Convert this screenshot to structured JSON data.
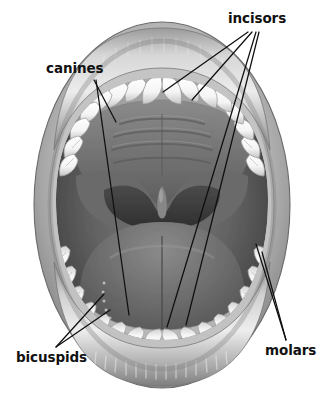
{
  "figure": {
    "type": "anatomical-illustration",
    "style": "grayscale halftone drawing",
    "background_color": "#ffffff",
    "ink_color": "#111111"
  },
  "labels": {
    "incisors": "incisors",
    "canines": "canines",
    "bicuspids": "bicuspids",
    "molars": "molars"
  },
  "colors": {
    "text": "#111111",
    "leader_line": "#101010",
    "lip_light": "#d8d8d8",
    "lip_mid": "#a6a6a6",
    "lip_dark": "#6f6f6f",
    "tooth_white": "#fbfbfb",
    "tooth_shadow": "#c9c9c9",
    "gum_light": "#bdbdbd",
    "gum_dark": "#8a8a8a",
    "cavity_dark": "#4a4a4a",
    "throat_black": "#3a3a3a",
    "tongue_mid": "#6e6e6e",
    "palate_gray": "#7b7b7b"
  },
  "anatomy_parts": [
    "upper lip",
    "lower lip",
    "upper gum",
    "lower gum",
    "hard palate with rugae",
    "soft palate",
    "uvula",
    "tongue",
    "upper teeth arch",
    "lower teeth arch",
    "oropharynx"
  ],
  "caption": ""
}
